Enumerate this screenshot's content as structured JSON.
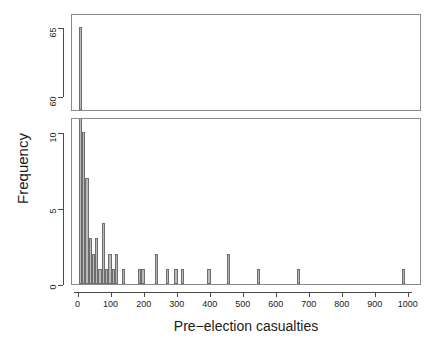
{
  "chart_data": {
    "type": "bar",
    "subtype": "histogram-with-axis-break",
    "title": "",
    "xlabel": "Pre−election casualties",
    "ylabel": "Frequency",
    "binwidth": 10,
    "xlim": [
      -20,
      1040
    ],
    "xticks": [
      0,
      100,
      200,
      300,
      400,
      500,
      600,
      700,
      800,
      900,
      1000
    ],
    "xticklabels": [
      "0",
      "100",
      "200",
      "300",
      "400",
      "500",
      "600",
      "700",
      "800",
      "900",
      "1000"
    ],
    "panels": [
      {
        "name": "upper-panel",
        "ylim": [
          59,
          66
        ],
        "yticks": [
          60,
          65
        ],
        "yticklabels": [
          "60",
          "65"
        ],
        "grid": false
      },
      {
        "name": "lower-panel",
        "ylim": [
          0,
          11
        ],
        "yticks": [
          0,
          5,
          10
        ],
        "yticklabels": [
          "0",
          "5",
          "10"
        ],
        "grid": false
      }
    ],
    "bins": [
      {
        "x0": 0,
        "x1": 10,
        "count": 65
      },
      {
        "x0": 10,
        "x1": 20,
        "count": 10
      },
      {
        "x0": 20,
        "x1": 30,
        "count": 7
      },
      {
        "x0": 30,
        "x1": 40,
        "count": 3
      },
      {
        "x0": 40,
        "x1": 50,
        "count": 2
      },
      {
        "x0": 50,
        "x1": 60,
        "count": 3
      },
      {
        "x0": 60,
        "x1": 70,
        "count": 1
      },
      {
        "x0": 70,
        "x1": 80,
        "count": 4
      },
      {
        "x0": 80,
        "x1": 90,
        "count": 1
      },
      {
        "x0": 90,
        "x1": 100,
        "count": 2
      },
      {
        "x0": 100,
        "x1": 110,
        "count": 1
      },
      {
        "x0": 110,
        "x1": 120,
        "count": 2
      },
      {
        "x0": 120,
        "x1": 130,
        "count": 0
      },
      {
        "x0": 130,
        "x1": 140,
        "count": 1
      },
      {
        "x0": 180,
        "x1": 190,
        "count": 1
      },
      {
        "x0": 190,
        "x1": 200,
        "count": 1
      },
      {
        "x0": 230,
        "x1": 240,
        "count": 2
      },
      {
        "x0": 265,
        "x1": 275,
        "count": 1
      },
      {
        "x0": 290,
        "x1": 300,
        "count": 1
      },
      {
        "x0": 310,
        "x1": 320,
        "count": 1
      },
      {
        "x0": 390,
        "x1": 400,
        "count": 1
      },
      {
        "x0": 450,
        "x1": 460,
        "count": 2
      },
      {
        "x0": 540,
        "x1": 550,
        "count": 1
      },
      {
        "x0": 660,
        "x1": 670,
        "count": 1
      },
      {
        "x0": 980,
        "x1": 990,
        "count": 1
      }
    ],
    "colors": {
      "bar_fill": "#b9b9b9",
      "bar_stroke": "#6e6e6e",
      "axis": "#4a4a4a",
      "frame": "#8a8a8a",
      "text": "#1a1a1a",
      "background": "#ffffff"
    }
  }
}
